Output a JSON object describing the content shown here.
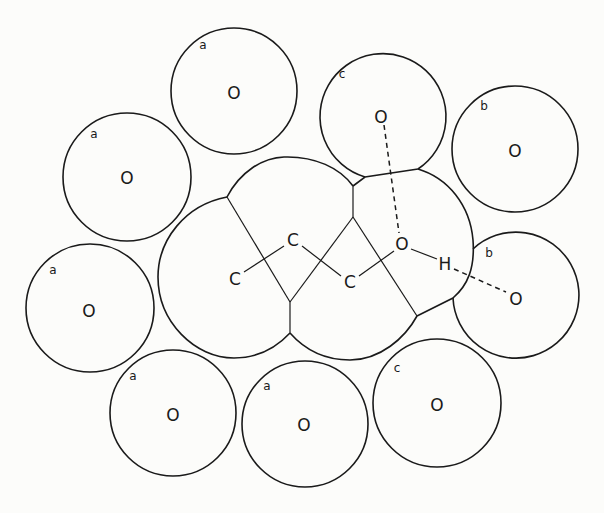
{
  "diagram": {
    "type": "molecular-solvation-shell",
    "molecule": {
      "atoms": [
        {
          "id": "C1",
          "label": "C",
          "x": 235,
          "y": 278
        },
        {
          "id": "C2",
          "label": "C",
          "x": 293,
          "y": 240
        },
        {
          "id": "C3",
          "label": "C",
          "x": 350,
          "y": 282
        },
        {
          "id": "O1",
          "label": "O",
          "x": 402,
          "y": 245
        },
        {
          "id": "H1",
          "label": "H",
          "x": 445,
          "y": 263
        }
      ],
      "bonds": [
        [
          "C1",
          "C2"
        ],
        [
          "C2",
          "C3"
        ],
        [
          "C3",
          "O1"
        ],
        [
          "O1",
          "H1"
        ]
      ]
    },
    "surrounding_spheres": [
      {
        "id": "s1",
        "class_label": "a",
        "atom_label": "O",
        "cx": 234,
        "cy": 91,
        "r": 63
      },
      {
        "id": "s2",
        "class_label": "c",
        "atom_label": "O",
        "cx": 382,
        "cy": 112,
        "r": 63
      },
      {
        "id": "s3",
        "class_label": "b",
        "atom_label": "O",
        "cx": 515,
        "cy": 149,
        "r": 63
      },
      {
        "id": "s4",
        "class_label": "a",
        "atom_label": "O",
        "cx": 127,
        "cy": 177,
        "r": 64
      },
      {
        "id": "s5",
        "class_label": "a",
        "atom_label": "O",
        "cx": 90,
        "cy": 308,
        "r": 64
      },
      {
        "id": "s6",
        "class_label": "b",
        "atom_label": "O",
        "cx": 515,
        "cy": 297,
        "r": 63
      },
      {
        "id": "s7",
        "class_label": "a",
        "atom_label": "O",
        "cx": 173,
        "cy": 413,
        "r": 63
      },
      {
        "id": "s8",
        "class_label": "a",
        "atom_label": "O",
        "cx": 305,
        "cy": 424,
        "r": 63
      },
      {
        "id": "s9",
        "class_label": "c",
        "atom_label": "O",
        "cx": 437,
        "cy": 403,
        "r": 64
      }
    ],
    "hydrogen_bonds": [
      {
        "from": "O1",
        "to": "s2",
        "style": "dashed"
      },
      {
        "from": "H1",
        "to": "s6",
        "style": "dashed"
      }
    ],
    "labels": {
      "s1_tag": "a",
      "s1_atom": "O",
      "s2_tag": "c",
      "s2_atom": "O",
      "s3_tag": "b",
      "s3_atom": "O",
      "s4_tag": "a",
      "s4_atom": "O",
      "s5_tag": "a",
      "s5_atom": "O",
      "s6_tag": "b",
      "s6_atom": "O",
      "s7_tag": "a",
      "s7_atom": "O",
      "s8_tag": "a",
      "s8_atom": "O",
      "s9_tag": "c",
      "s9_atom": "O",
      "c1": "C",
      "c2": "C",
      "c3": "C",
      "o1": "O",
      "h1": "H"
    }
  }
}
